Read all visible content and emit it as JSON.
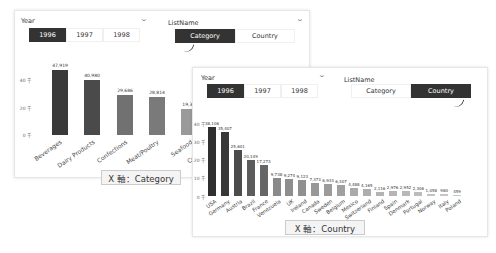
{
  "panel_category": {
    "year_slicer": {
      "label": "Year",
      "options": [
        "1996",
        "1997",
        "1998"
      ],
      "selected": "1996"
    },
    "listname_slicer": {
      "label": "ListName",
      "options": [
        "Category",
        "Country"
      ],
      "selected": "Category"
    },
    "caption": "X 軸：Category",
    "y_ticks": [
      "40 千",
      "20 千",
      "0 千"
    ]
  },
  "panel_country": {
    "year_slicer": {
      "label": "Year",
      "options": [
        "1996",
        "1997",
        "1998"
      ],
      "selected": "1996"
    },
    "listname_slicer": {
      "label": "ListName",
      "options": [
        "Category",
        "Country"
      ],
      "selected": "Country"
    },
    "caption": "X 軸：Country",
    "y_ticks": [
      "40 千",
      "30 千",
      "20 千",
      "10 千",
      "0 千"
    ]
  },
  "chart_data": [
    {
      "type": "bar",
      "title": "",
      "xlabel": "Category",
      "ylabel": "",
      "ylim": [
        0,
        50000
      ],
      "categories": [
        "Beverages",
        "Dairy Products",
        "Confections",
        "Meat/Poultry",
        "Seafood",
        "Condiments"
      ],
      "values": [
        47919,
        40980,
        29686,
        28814,
        19390,
        null
      ],
      "value_labels": [
        "47,919",
        "40,980",
        "29,686",
        "28,814",
        "19,39…",
        ""
      ]
    },
    {
      "type": "bar",
      "title": "",
      "xlabel": "Country",
      "ylabel": "",
      "ylim": [
        0,
        40000
      ],
      "categories": [
        "USA",
        "Germany",
        "Austria",
        "Brazil",
        "France",
        "Venezuela",
        "UK",
        "Ireland",
        "Canada",
        "Sweden",
        "Belgium",
        "Mexico",
        "Switzerland",
        "Finland",
        "Spain",
        "Denmark",
        "Portugal",
        "Norway",
        "Italy",
        "Poland"
      ],
      "values": [
        38106,
        35407,
        25601,
        20149,
        17273,
        9738,
        9274,
        9123,
        7373,
        6933,
        6307,
        4488,
        4165,
        2116,
        2976,
        2952,
        2306,
        1058,
        980,
        459
      ],
      "value_labels": [
        "38,106",
        "35,407",
        "25,601",
        "20,149",
        "17,273",
        "9,738",
        "9,274",
        "9,123",
        "7,373",
        "6,933",
        "6,307",
        "4,488",
        "4,165",
        "2,116",
        "2,976",
        "2,952",
        "2,306",
        "1,058",
        "980",
        "459"
      ]
    }
  ]
}
